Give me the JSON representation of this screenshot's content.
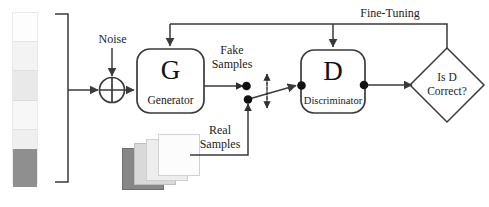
{
  "diagram": {
    "nodes": {
      "generator": {
        "symbol": "G",
        "caption": "Generator"
      },
      "discriminator": {
        "symbol": "D",
        "caption": "Discriminator"
      },
      "decision": {
        "line1": "Is D",
        "line2": "Correct?"
      }
    },
    "labels": {
      "noise": "Noise",
      "fake_samples_l1": "Fake",
      "fake_samples_l2": "Samples",
      "real_samples_l1": "Real",
      "real_samples_l2": "Samples",
      "fine_tuning": "Fine-Tuning"
    },
    "colors": {
      "stroke": "#3a3a3a",
      "text": "#1a1a1a",
      "background": "#ffffff",
      "latent_dark": "#8f8f8f",
      "card_dark": "#878787",
      "card_light": "#ffffff"
    },
    "latent_vector_segments": [
      {
        "name": "segment-1",
        "color": "#fdfdfd"
      },
      {
        "name": "segment-2",
        "color": "#f4f4f4"
      },
      {
        "name": "segment-3",
        "color": "#eaeaea"
      },
      {
        "name": "segment-4",
        "color": "#f7f7f7"
      },
      {
        "name": "segment-5",
        "color": "#efefef"
      },
      {
        "name": "segment-6",
        "color": "#8f8f8f"
      }
    ],
    "real_sample_cards": [
      {
        "name": "card-back",
        "fill": "#878787",
        "border": "#6f6f6f"
      },
      {
        "name": "card-third",
        "fill": "#d8d8d8",
        "border": "#bdbdbd"
      },
      {
        "name": "card-second",
        "fill": "#ececec",
        "border": "#cfcfcf"
      },
      {
        "name": "card-front",
        "fill": "#fcfcfc",
        "border": "#d3d3d3"
      }
    ],
    "icons": {
      "sum_operator": "plus-circle-icon",
      "bidirectional": "double-arrow-vertical-icon"
    }
  }
}
